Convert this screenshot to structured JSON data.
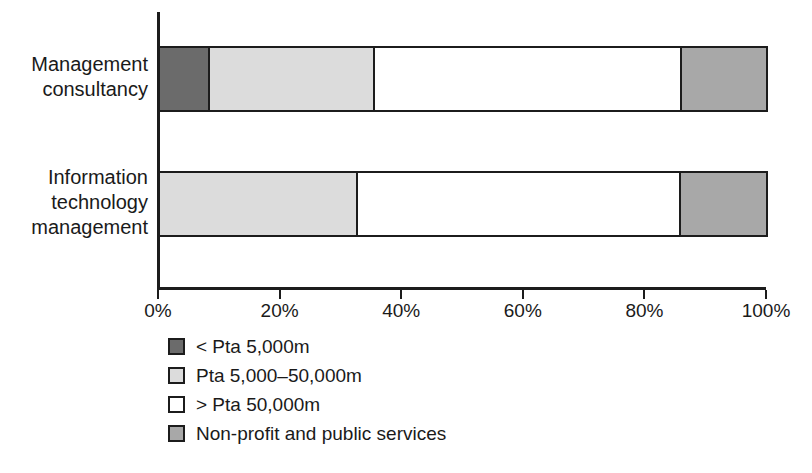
{
  "chart_data": {
    "type": "bar",
    "orientation": "horizontal",
    "stacked": true,
    "stack_total": 100,
    "title": "",
    "subtitle": "",
    "xlabel": "",
    "ylabel": "",
    "xlim": [
      0,
      100
    ],
    "grid": false,
    "legend_position": "bottom-left",
    "categories": [
      "Management consultancy",
      "Information technology management"
    ],
    "category_label_lines": [
      [
        "Management",
        "consultancy"
      ],
      [
        "Information",
        "technology",
        "management"
      ]
    ],
    "x_tick_values": [
      0,
      20,
      40,
      60,
      80,
      100
    ],
    "x_tick_labels": [
      "0%",
      "20%",
      "40%",
      "60%",
      "80%",
      "100%"
    ],
    "series": [
      {
        "name": "< Pta 5,000m",
        "color": "#6b6b6b",
        "values": [
          8.2,
          0.0
        ]
      },
      {
        "name": "Pta 5,000–50,000m",
        "color": "#dcdcdc",
        "values": [
          27.2,
          32.6
        ]
      },
      {
        "name": "> Pta 50,000m",
        "color": "#ffffff",
        "values": [
          50.8,
          53.4
        ]
      },
      {
        "name": "Non-profit and public services",
        "color": "#a8a8a8",
        "values": [
          13.8,
          14.0
        ]
      }
    ],
    "colors": {
      "axis": "#1c1c1c",
      "outline": "#1c1c1c",
      "text": "#1a1a1a",
      "background": "#ffffff",
      "dark_gray": "#6b6b6b",
      "light_gray": "#dcdcdc",
      "white": "#ffffff",
      "medium_gray": "#a8a8a8"
    }
  },
  "legend": {
    "items": [
      {
        "label": "< Pta 5,000m",
        "color": "#6b6b6b"
      },
      {
        "label": "Pta 5,000–50,000m",
        "color": "#dcdcdc"
      },
      {
        "label": "> Pta 50,000m",
        "color": "#ffffff"
      },
      {
        "label": "Non-profit and public services",
        "color": "#a8a8a8"
      }
    ]
  }
}
